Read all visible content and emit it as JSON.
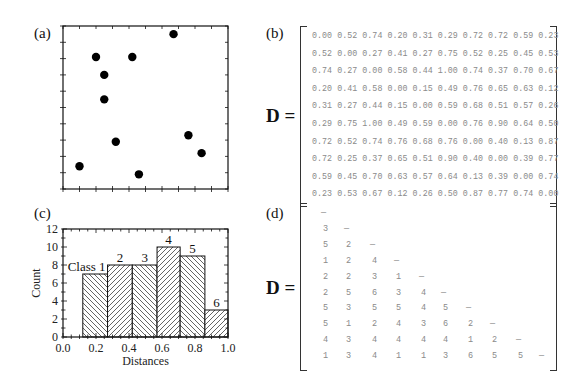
{
  "panels": {
    "a": {
      "label": "(a)"
    },
    "b": {
      "label": "(b)",
      "matrix_label": "D ="
    },
    "c": {
      "label": "(c)"
    },
    "d": {
      "label": "(d)",
      "matrix_label": "D ="
    }
  },
  "chart_data": [
    {
      "type": "scatter",
      "panel": "(a)",
      "title": "",
      "xlabel": "",
      "ylabel": "",
      "xlim": [
        0,
        1
      ],
      "ylim": [
        0,
        1
      ],
      "grid": false,
      "points": [
        {
          "x": 0.2,
          "y": 0.81
        },
        {
          "x": 0.42,
          "y": 0.81
        },
        {
          "x": 0.25,
          "y": 0.7
        },
        {
          "x": 0.25,
          "y": 0.55
        },
        {
          "x": 0.32,
          "y": 0.29
        },
        {
          "x": 0.67,
          "y": 0.95
        },
        {
          "x": 0.76,
          "y": 0.33
        },
        {
          "x": 0.84,
          "y": 0.22
        },
        {
          "x": 0.1,
          "y": 0.14
        },
        {
          "x": 0.46,
          "y": 0.09
        }
      ]
    },
    {
      "type": "bar",
      "panel": "(c)",
      "title": "",
      "xlabel": "Distances",
      "ylabel": "Count",
      "xlim": [
        0.0,
        1.0
      ],
      "ylim": [
        0,
        12
      ],
      "xticks": [
        "0.0",
        "0.2",
        "0.4",
        "0.6",
        "0.8",
        "1.0"
      ],
      "yticks": [
        "0",
        "2",
        "4",
        "6",
        "8",
        "10",
        "12"
      ],
      "categories": [
        "Class 1",
        "2",
        "3",
        "4",
        "5",
        "6"
      ],
      "bin_edges": [
        0.12,
        0.27,
        0.42,
        0.57,
        0.71,
        0.86,
        1.0
      ],
      "values": [
        7,
        8,
        8,
        10,
        9,
        3
      ],
      "hatch": [
        "\\\\",
        "//",
        "\\\\",
        "//",
        "\\\\",
        "//"
      ]
    }
  ],
  "distance_matrix": [
    [
      "0.00",
      "0.52",
      "0.74",
      "0.20",
      "0.31",
      "0.29",
      "0.72",
      "0.72",
      "0.59",
      "0.23"
    ],
    [
      "0.52",
      "0.00",
      "0.27",
      "0.41",
      "0.27",
      "0.75",
      "0.52",
      "0.25",
      "0.45",
      "0.53"
    ],
    [
      "0.74",
      "0.27",
      "0.00",
      "0.58",
      "0.44",
      "1.00",
      "0.74",
      "0.37",
      "0.70",
      "0.67"
    ],
    [
      "0.20",
      "0.41",
      "0.58",
      "0.00",
      "0.15",
      "0.49",
      "0.76",
      "0.65",
      "0.63",
      "0.12"
    ],
    [
      "0.31",
      "0.27",
      "0.44",
      "0.15",
      "0.00",
      "0.59",
      "0.68",
      "0.51",
      "0.57",
      "0.26"
    ],
    [
      "0.29",
      "0.75",
      "1.00",
      "0.49",
      "0.59",
      "0.00",
      "0.76",
      "0.90",
      "0.64",
      "0.50"
    ],
    [
      "0.72",
      "0.52",
      "0.74",
      "0.76",
      "0.68",
      "0.76",
      "0.00",
      "0.40",
      "0.13",
      "0.87"
    ],
    [
      "0.72",
      "0.25",
      "0.37",
      "0.65",
      "0.51",
      "0.90",
      "0.40",
      "0.00",
      "0.39",
      "0.77"
    ],
    [
      "0.59",
      "0.45",
      "0.70",
      "0.63",
      "0.57",
      "0.64",
      "0.13",
      "0.39",
      "0.00",
      "0.74"
    ],
    [
      "0.23",
      "0.53",
      "0.67",
      "0.12",
      "0.26",
      "0.50",
      "0.87",
      "0.77",
      "0.74",
      "0.00"
    ]
  ],
  "class_matrix": [
    [
      "—"
    ],
    [
      "3",
      "—"
    ],
    [
      "5",
      "2",
      "—"
    ],
    [
      "1",
      "2",
      "4",
      "—"
    ],
    [
      "2",
      "2",
      "3",
      "1",
      "—"
    ],
    [
      "2",
      "5",
      "6",
      "3",
      "4",
      "—"
    ],
    [
      "5",
      "3",
      "5",
      "5",
      "4",
      "5",
      "—"
    ],
    [
      "5",
      "1",
      "2",
      "4",
      "3",
      "6",
      "2",
      "—"
    ],
    [
      "4",
      "3",
      "4",
      "4",
      "4",
      "4",
      "1",
      "2",
      "—"
    ],
    [
      "1",
      "3",
      "4",
      "1",
      "1",
      "3",
      "6",
      "5",
      "5",
      "—"
    ]
  ]
}
